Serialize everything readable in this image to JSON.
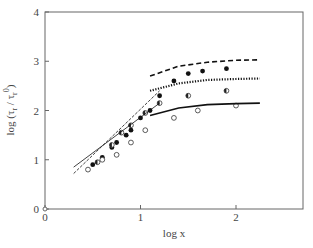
{
  "chart_data": {
    "type": "scatter",
    "title": "",
    "xlabel": "log x",
    "ylabel": "log (τ_r / τ_r^0)",
    "xlim": [
      0,
      2.7
    ],
    "ylim": [
      0,
      4
    ],
    "xticks": [
      "0",
      "1",
      "2"
    ],
    "yticks": [
      "0",
      "1",
      "2",
      "3",
      "4"
    ],
    "grid": false,
    "legend": null,
    "series": [
      {
        "name": "filled circles",
        "marker": "filled",
        "x": [
          0.5,
          0.6,
          0.7,
          0.75,
          0.85,
          0.9,
          1.0,
          1.1,
          1.2,
          1.35,
          1.5,
          1.65,
          1.9
        ],
        "y": [
          0.9,
          1.05,
          1.25,
          1.35,
          1.5,
          1.6,
          1.85,
          2.0,
          2.3,
          2.6,
          2.75,
          2.8,
          2.85
        ]
      },
      {
        "name": "half-filled circles",
        "marker": "half",
        "x": [
          0.55,
          0.7,
          0.8,
          0.9,
          1.05,
          1.2,
          1.5,
          1.9
        ],
        "y": [
          0.95,
          1.3,
          1.55,
          1.7,
          1.95,
          2.15,
          2.3,
          2.4
        ]
      },
      {
        "name": "open circles",
        "marker": "open",
        "x": [
          0.45,
          0.6,
          0.75,
          0.9,
          1.05,
          1.35,
          1.6,
          2.0
        ],
        "y": [
          0.8,
          1.0,
          1.1,
          1.35,
          1.6,
          1.85,
          2.0,
          2.1
        ]
      },
      {
        "name": "thin solid fit",
        "style": "thin-solid",
        "x": [
          0.3,
          1.2
        ],
        "y": [
          0.85,
          2.15
        ]
      },
      {
        "name": "thin dashed fit",
        "style": "thin-dashed",
        "x": [
          0.3,
          1.2
        ],
        "y": [
          0.72,
          2.4
        ]
      },
      {
        "name": "upper dashed",
        "style": "dashed",
        "x": [
          1.1,
          1.4,
          1.7,
          2.0,
          2.25
        ],
        "y": [
          2.7,
          2.9,
          2.98,
          3.02,
          3.03
        ]
      },
      {
        "name": "dotted",
        "style": "dotted",
        "x": [
          1.1,
          1.4,
          1.7,
          2.0,
          2.25
        ],
        "y": [
          2.4,
          2.55,
          2.62,
          2.64,
          2.65
        ]
      },
      {
        "name": "solid",
        "style": "solid",
        "x": [
          1.1,
          1.4,
          1.7,
          2.0,
          2.25
        ],
        "y": [
          1.9,
          2.05,
          2.12,
          2.14,
          2.15
        ]
      }
    ]
  }
}
